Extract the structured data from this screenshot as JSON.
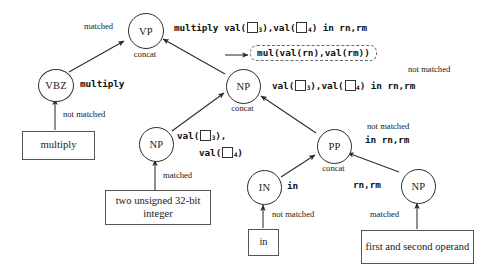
{
  "diagram": {
    "nodes": [
      {
        "id": "vp",
        "label": "VP",
        "sublabel": "concat"
      },
      {
        "id": "vbz",
        "label": "VBZ",
        "sublabel": ""
      },
      {
        "id": "np_mid",
        "label": "NP",
        "sublabel": "concat"
      },
      {
        "id": "np_left",
        "label": "NP",
        "sublabel": ""
      },
      {
        "id": "pp",
        "label": "PP",
        "sublabel": "concat"
      },
      {
        "id": "in",
        "label": "IN",
        "sublabel": ""
      },
      {
        "id": "np_right",
        "label": "NP",
        "sublabel": ""
      }
    ],
    "leaf_boxes": [
      {
        "id": "leaf-multiply",
        "text": "multiply"
      },
      {
        "id": "leaf-two-unsigned",
        "text": "two unsigned 32-bit integer"
      },
      {
        "id": "leaf-in",
        "text": "in"
      },
      {
        "id": "leaf-first-second",
        "text": "first and second operand"
      }
    ],
    "edge_labels": [
      {
        "id": "vbz-to-vp",
        "text": "matched"
      },
      {
        "id": "multiply-to-vbz",
        "text": "not matched"
      },
      {
        "id": "two-unsigned-to-np",
        "text": "matched"
      },
      {
        "id": "in-to-IN",
        "text": "not matched"
      },
      {
        "id": "first-second-to-np",
        "text": "matched"
      },
      {
        "id": "np-mid-right",
        "text": "not matched"
      },
      {
        "id": "pp-right",
        "text": "not matched"
      }
    ],
    "code_labels": {
      "vbz_value": "multiply",
      "in_value": "in",
      "np_right_value": "rn,rm",
      "pp_value": "in rn,rm",
      "vp_line": {
        "head": "multiply val(",
        "sub_a": "3",
        "mid": "),val(",
        "sub_b": "4",
        "tail": ") in rn,rm"
      },
      "np_mid_line": {
        "head": "val(",
        "sub_a": "3",
        "mid": "),val(",
        "sub_b": "4",
        "tail": ") in rn,rm"
      },
      "np_left_line1": {
        "head": "val(",
        "sub_a": "3",
        "tail": "),"
      },
      "np_left_line2": {
        "head": "val(",
        "sub_b": "4",
        "tail": ")"
      },
      "generated": "mul(val(rn),val(rm))"
    },
    "colors": {
      "ink": "#1a1a1a",
      "line": "#2b2b2b",
      "box_border": "#555555",
      "dashed_border": "#6a6a6a",
      "background": "#ffffff"
    }
  }
}
